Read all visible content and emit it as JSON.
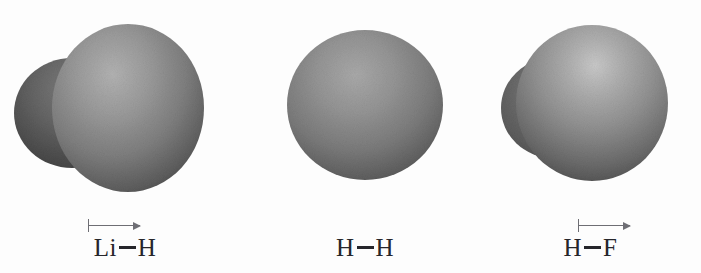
{
  "figure": {
    "background_color": "#fdfdfd",
    "caption_text_color": "#26262b",
    "arrow_color": "#6e6e74",
    "surface_light_color": "#c8c8c8",
    "surface_mid_color": "#8a8a8a",
    "surface_dark_color": "#3a3a3a"
  },
  "molecules": [
    {
      "id": "lih",
      "formula_left_atom": "Li",
      "formula_right_atom": "H",
      "label": "Li—H",
      "has_dipole_arrow": true,
      "dipole_direction": "left-to-right",
      "surface_shape": "peanut",
      "surface_name": "lithium-hydride-electron-density-surface"
    },
    {
      "id": "hh",
      "formula_left_atom": "H",
      "formula_right_atom": "H",
      "label": "H—H",
      "has_dipole_arrow": false,
      "dipole_direction": "none",
      "surface_shape": "ellipse",
      "surface_name": "dihydrogen-electron-density-surface"
    },
    {
      "id": "hf",
      "formula_left_atom": "H",
      "formula_right_atom": "F",
      "label": "H—F",
      "has_dipole_arrow": true,
      "dipole_direction": "left-to-right",
      "surface_shape": "egg",
      "surface_name": "hydrogen-fluoride-electron-density-surface"
    }
  ]
}
